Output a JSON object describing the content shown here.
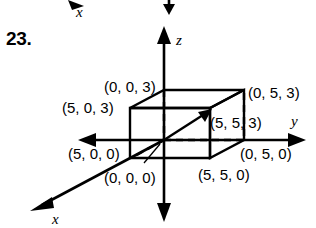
{
  "problem": {
    "number": "23."
  },
  "figure": {
    "type": "3d-coordinate-box-diagram",
    "axes": [
      {
        "name": "x-axis",
        "label": "x",
        "direction": "down-left"
      },
      {
        "name": "y-axis",
        "label": "y",
        "direction": "right"
      },
      {
        "name": "z-axis",
        "label": "z",
        "direction": "up"
      }
    ],
    "axis_labels": {
      "x": "x",
      "y": "y",
      "z": "z"
    },
    "vertex_labels": [
      {
        "id": "v-origin",
        "text": "(0, 0, 0)"
      },
      {
        "id": "v-5-0-0",
        "text": "(5, 0, 0)"
      },
      {
        "id": "v-0-5-0",
        "text": "(0, 5, 0)"
      },
      {
        "id": "v-5-5-0",
        "text": "(5, 5, 0)"
      },
      {
        "id": "v-0-0-3",
        "text": "(0, 0, 3)"
      },
      {
        "id": "v-5-0-3",
        "text": "(5, 0, 3)"
      },
      {
        "id": "v-0-5-3",
        "text": "(0, 5, 3)"
      },
      {
        "id": "v-5-5-3",
        "text": "(5, 5, 3)"
      }
    ],
    "box_dimensions": {
      "x_length": 5,
      "y_length": 5,
      "z_height": 3
    },
    "diagonal_arrow": {
      "from": "(0, 0, 0)",
      "to": "(5, 5, 3)"
    },
    "colors": {
      "ink": "#000000",
      "background": "#ffffff"
    }
  },
  "partial_previous_figure": {
    "x_axis_label": "x"
  }
}
